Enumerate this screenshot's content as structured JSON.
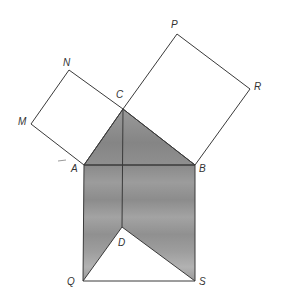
{
  "diagram": {
    "type": "geometry-figure",
    "colors": {
      "line": "#3a3a3a",
      "shade": "#8f8f8f",
      "shade_light": "#a8a8a8",
      "background": "#ffffff",
      "label": "#333333"
    },
    "vertices": {
      "A": {
        "label": "A",
        "x": 84,
        "y": 165
      },
      "B": {
        "label": "B",
        "x": 195,
        "y": 165
      },
      "C": {
        "label": "C",
        "x": 123,
        "y": 109
      },
      "D": {
        "label": "D",
        "x": 122,
        "y": 227
      },
      "M": {
        "label": "M",
        "x": 31,
        "y": 124
      },
      "N": {
        "label": "N",
        "x": 69,
        "y": 70
      },
      "P": {
        "label": "P",
        "x": 177,
        "y": 34
      },
      "R": {
        "label": "R",
        "x": 250,
        "y": 89
      },
      "Q": {
        "label": "Q",
        "x": 83,
        "y": 281
      },
      "S": {
        "label": "S",
        "x": 195,
        "y": 281
      }
    },
    "labels": [
      {
        "id": "A",
        "text": "A",
        "x": 71,
        "y": 172
      },
      {
        "id": "B",
        "text": "B",
        "x": 199,
        "y": 172
      },
      {
        "id": "C",
        "text": "C",
        "x": 116,
        "y": 98
      },
      {
        "id": "D",
        "text": "D",
        "x": 118,
        "y": 246
      },
      {
        "id": "M",
        "text": "M",
        "x": 18,
        "y": 125
      },
      {
        "id": "N",
        "text": "N",
        "x": 63,
        "y": 66
      },
      {
        "id": "P",
        "text": "P",
        "x": 171,
        "y": 28
      },
      {
        "id": "R",
        "text": "R",
        "x": 254,
        "y": 90
      },
      {
        "id": "Q",
        "text": "Q",
        "x": 67,
        "y": 285
      },
      {
        "id": "S",
        "text": "S",
        "x": 199,
        "y": 285
      }
    ],
    "polygons": {
      "square_AC": [
        "A",
        "M",
        "N",
        "C"
      ],
      "square_BC": [
        "C",
        "P",
        "R",
        "B"
      ],
      "shaded_triangle_ABC": [
        "A",
        "B",
        "C"
      ],
      "shaded_left": [
        "A",
        "Q",
        "D"
      ],
      "shaded_right": [
        "B",
        "S",
        "D"
      ],
      "unshaded_triangle_QDS": [
        "Q",
        "D",
        "S"
      ]
    },
    "segments": [
      [
        "A",
        "B"
      ],
      [
        "C",
        "D"
      ],
      [
        "A",
        "Q"
      ],
      [
        "B",
        "S"
      ],
      [
        "Q",
        "S"
      ],
      [
        "Q",
        "D"
      ],
      [
        "D",
        "S"
      ]
    ]
  }
}
